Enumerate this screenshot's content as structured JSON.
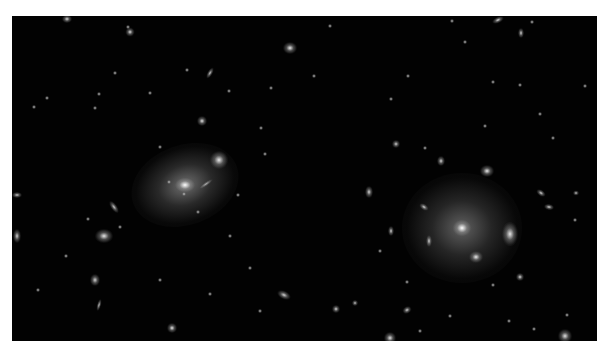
{
  "image": {
    "subject": "galaxy cluster deep-field image",
    "background_color": "#020202",
    "border_color": "#ffffff",
    "frame": {
      "x": 12,
      "y": 16,
      "width": 585,
      "height": 325
    },
    "objects": [
      {
        "name": "bcg-left-halo",
        "x": 185,
        "y": 185,
        "w": 110,
        "h": 80,
        "rot": -20,
        "core": "rgba(200,200,200,0.55)",
        "glow": 0.55
      },
      {
        "name": "bcg-left-core",
        "x": 185,
        "y": 185,
        "w": 22,
        "h": 16,
        "rot": 0,
        "core": "rgba(255,255,255,1)",
        "glow": 1
      },
      {
        "name": "left-companion",
        "x": 219,
        "y": 160,
        "w": 18,
        "h": 18,
        "rot": 0,
        "core": "rgba(235,235,235,1)",
        "glow": 1
      },
      {
        "name": "left-arc",
        "x": 206,
        "y": 184,
        "w": 16,
        "h": 4,
        "rot": -35,
        "core": "rgba(190,190,190,0.9)",
        "glow": 0.9
      },
      {
        "name": "bcg-right-halo",
        "x": 462,
        "y": 228,
        "w": 120,
        "h": 110,
        "rot": 0,
        "core": "rgba(190,190,190,0.5)",
        "glow": 0.5
      },
      {
        "name": "bcg-right-core",
        "x": 462,
        "y": 228,
        "w": 20,
        "h": 18,
        "rot": 0,
        "core": "rgba(255,255,255,1)",
        "glow": 1
      },
      {
        "name": "right-companion-1",
        "x": 510,
        "y": 234,
        "w": 16,
        "h": 24,
        "rot": 0,
        "core": "rgba(230,230,230,1)",
        "glow": 1
      },
      {
        "name": "right-companion-2",
        "x": 476,
        "y": 257,
        "w": 14,
        "h": 12,
        "rot": 0,
        "core": "rgba(235,235,235,1)",
        "glow": 1
      },
      {
        "name": "right-top",
        "x": 487,
        "y": 171,
        "w": 14,
        "h": 12,
        "rot": 0,
        "core": "rgba(235,235,235,1)",
        "glow": 1
      },
      {
        "name": "g1",
        "x": 104,
        "y": 236,
        "w": 18,
        "h": 14,
        "rot": 0,
        "core": "rgba(230,230,230,1)",
        "glow": 1
      },
      {
        "name": "g2",
        "x": 114,
        "y": 207,
        "w": 6,
        "h": 14,
        "rot": -35,
        "core": "rgba(200,200,200,1)",
        "glow": 1
      },
      {
        "name": "g3",
        "x": 17,
        "y": 236,
        "w": 8,
        "h": 14,
        "rot": 0,
        "core": "rgba(210,210,210,1)",
        "glow": 1
      },
      {
        "name": "g4",
        "x": 17,
        "y": 195,
        "w": 10,
        "h": 6,
        "rot": 0,
        "core": "rgba(200,200,200,1)",
        "glow": 1
      },
      {
        "name": "g5",
        "x": 95,
        "y": 280,
        "w": 10,
        "h": 12,
        "rot": 0,
        "core": "rgba(210,210,210,1)",
        "glow": 1
      },
      {
        "name": "g6",
        "x": 172,
        "y": 328,
        "w": 10,
        "h": 10,
        "rot": 0,
        "core": "rgba(230,230,230,1)",
        "glow": 1
      },
      {
        "name": "g7",
        "x": 284,
        "y": 295,
        "w": 14,
        "h": 8,
        "rot": 25,
        "core": "rgba(210,210,210,1)",
        "glow": 1
      },
      {
        "name": "g8",
        "x": 290,
        "y": 48,
        "w": 14,
        "h": 12,
        "rot": 0,
        "core": "rgba(235,235,235,1)",
        "glow": 1
      },
      {
        "name": "g9",
        "x": 130,
        "y": 32,
        "w": 9,
        "h": 9,
        "rot": 0,
        "core": "rgba(220,220,220,1)",
        "glow": 1
      },
      {
        "name": "g10",
        "x": 67,
        "y": 19,
        "w": 10,
        "h": 8,
        "rot": 0,
        "core": "rgba(220,220,220,1)",
        "glow": 1
      },
      {
        "name": "g11",
        "x": 210,
        "y": 73,
        "w": 5,
        "h": 12,
        "rot": 30,
        "core": "rgba(200,200,200,1)",
        "glow": 1
      },
      {
        "name": "g12",
        "x": 202,
        "y": 121,
        "w": 10,
        "h": 10,
        "rot": 0,
        "core": "rgba(225,225,225,1)",
        "glow": 1
      },
      {
        "name": "g13",
        "x": 396,
        "y": 144,
        "w": 8,
        "h": 8,
        "rot": 0,
        "core": "rgba(210,210,210,1)",
        "glow": 1
      },
      {
        "name": "g14",
        "x": 441,
        "y": 161,
        "w": 8,
        "h": 10,
        "rot": 0,
        "core": "rgba(210,210,210,1)",
        "glow": 1
      },
      {
        "name": "g15",
        "x": 369,
        "y": 192,
        "w": 8,
        "h": 12,
        "rot": 0,
        "core": "rgba(215,215,215,1)",
        "glow": 1
      },
      {
        "name": "g16",
        "x": 424,
        "y": 207,
        "w": 10,
        "h": 6,
        "rot": 35,
        "core": "rgba(210,210,210,1)",
        "glow": 1
      },
      {
        "name": "g17",
        "x": 391,
        "y": 231,
        "w": 6,
        "h": 10,
        "rot": 0,
        "core": "rgba(210,210,210,1)",
        "glow": 1
      },
      {
        "name": "g18",
        "x": 429,
        "y": 241,
        "w": 6,
        "h": 12,
        "rot": 0,
        "core": "rgba(210,210,210,1)",
        "glow": 1
      },
      {
        "name": "g19",
        "x": 541,
        "y": 193,
        "w": 10,
        "h": 6,
        "rot": 35,
        "core": "rgba(210,210,210,1)",
        "glow": 1
      },
      {
        "name": "g20",
        "x": 549,
        "y": 207,
        "w": 10,
        "h": 6,
        "rot": 10,
        "core": "rgba(210,210,210,1)",
        "glow": 1
      },
      {
        "name": "g21",
        "x": 520,
        "y": 277,
        "w": 8,
        "h": 8,
        "rot": 0,
        "core": "rgba(220,220,220,1)",
        "glow": 1
      },
      {
        "name": "g22",
        "x": 407,
        "y": 310,
        "w": 9,
        "h": 7,
        "rot": -30,
        "core": "rgba(210,210,210,1)",
        "glow": 1
      },
      {
        "name": "g23",
        "x": 390,
        "y": 338,
        "w": 12,
        "h": 12,
        "rot": 0,
        "core": "rgba(225,225,225,1)",
        "glow": 1
      },
      {
        "name": "g24",
        "x": 565,
        "y": 336,
        "w": 14,
        "h": 14,
        "rot": 0,
        "core": "rgba(225,225,225,1)",
        "glow": 1
      },
      {
        "name": "g25",
        "x": 498,
        "y": 20,
        "w": 12,
        "h": 6,
        "rot": -25,
        "core": "rgba(220,220,220,1)",
        "glow": 1
      },
      {
        "name": "g26",
        "x": 521,
        "y": 33,
        "w": 6,
        "h": 10,
        "rot": 0,
        "core": "rgba(210,210,210,1)",
        "glow": 1
      },
      {
        "name": "g27",
        "x": 576,
        "y": 193,
        "w": 6,
        "h": 5,
        "rot": 0,
        "core": "rgba(200,200,200,1)",
        "glow": 1
      },
      {
        "name": "g28",
        "x": 336,
        "y": 309,
        "w": 8,
        "h": 8,
        "rot": 0,
        "core": "rgba(215,215,215,1)",
        "glow": 1
      },
      {
        "name": "g29",
        "x": 99,
        "y": 305,
        "w": 4,
        "h": 12,
        "rot": 15,
        "core": "rgba(190,190,190,1)",
        "glow": 1
      },
      {
        "name": "g30",
        "x": 355,
        "y": 303,
        "w": 6,
        "h": 6,
        "rot": 0,
        "core": "rgba(200,200,200,1)",
        "glow": 1
      }
    ],
    "stars": [
      [
        99,
        94
      ],
      [
        47,
        98
      ],
      [
        34,
        107
      ],
      [
        95,
        108
      ],
      [
        150,
        93
      ],
      [
        160,
        147
      ],
      [
        115,
        73
      ],
      [
        187,
        70
      ],
      [
        128,
        27
      ],
      [
        229,
        91
      ],
      [
        271,
        88
      ],
      [
        314,
        76
      ],
      [
        261,
        128
      ],
      [
        265,
        154
      ],
      [
        238,
        195
      ],
      [
        230,
        236
      ],
      [
        250,
        268
      ],
      [
        198,
        212
      ],
      [
        184,
        194
      ],
      [
        169,
        182
      ],
      [
        88,
        219
      ],
      [
        66,
        256
      ],
      [
        38,
        290
      ],
      [
        120,
        227
      ],
      [
        330,
        26
      ],
      [
        452,
        21
      ],
      [
        532,
        22
      ],
      [
        408,
        76
      ],
      [
        391,
        99
      ],
      [
        465,
        42
      ],
      [
        425,
        148
      ],
      [
        493,
        82
      ],
      [
        520,
        85
      ],
      [
        540,
        114
      ],
      [
        553,
        138
      ],
      [
        485,
        126
      ],
      [
        407,
        282
      ],
      [
        450,
        316
      ],
      [
        493,
        285
      ],
      [
        509,
        321
      ],
      [
        534,
        329
      ],
      [
        567,
        315
      ],
      [
        380,
        251
      ],
      [
        420,
        331
      ],
      [
        260,
        311
      ],
      [
        210,
        294
      ],
      [
        160,
        280
      ],
      [
        585,
        86
      ],
      [
        575,
        220
      ]
    ]
  }
}
